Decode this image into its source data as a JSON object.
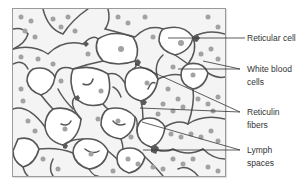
{
  "figure": {
    "colors": {
      "background": "#f4f4f4",
      "fiber": "#555555",
      "cell_body": "#5a5a5a",
      "wbc": "#9c9c9c",
      "lymph_space": "#ffffff",
      "leader": "#333333",
      "label_text": "#333333"
    }
  },
  "labels": [
    {
      "id": "reticular-cell",
      "line1": "Reticular cell",
      "line2": ""
    },
    {
      "id": "white-blood-cells",
      "line1": "White blood",
      "line2": "cells"
    },
    {
      "id": "reticulin-fibers",
      "line1": "Reticulin",
      "line2": "fibers"
    },
    {
      "id": "lymph-spaces",
      "line1": "Lymph",
      "line2": "spaces"
    }
  ]
}
